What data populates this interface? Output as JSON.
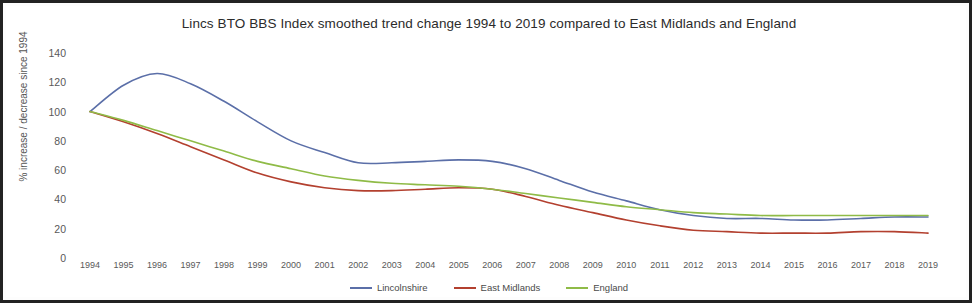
{
  "chart_data": {
    "type": "line",
    "title": "Lincs BTO BBS Index smoothed trend change 1994 to 2019 compared to East Midlands and England",
    "xlabel": "",
    "ylabel": "% increase / decrease since 1994",
    "ylim": [
      0,
      140
    ],
    "ytick_values": [
      0,
      20,
      40,
      60,
      80,
      100,
      120,
      140
    ],
    "grid": false,
    "legend_position": "bottom",
    "categories": [
      "1994",
      "1995",
      "1996",
      "1997",
      "1998",
      "1999",
      "2000",
      "2001",
      "2002",
      "2003",
      "2004",
      "2005",
      "2006",
      "2007",
      "2008",
      "2009",
      "2010",
      "2011",
      "2012",
      "2013",
      "2014",
      "2015",
      "2016",
      "2017",
      "2018",
      "2019"
    ],
    "series": [
      {
        "name": "Lincolnshire",
        "color": "#5b6fa8",
        "values": [
          100,
          118,
          126,
          119,
          107,
          93,
          80,
          72,
          65,
          65,
          66,
          67,
          66,
          61,
          53,
          45,
          39,
          33,
          29,
          27,
          27,
          26,
          26,
          27,
          28,
          28
        ]
      },
      {
        "name": "East Midlands",
        "color": "#b3402f",
        "values": [
          100,
          93,
          85,
          76,
          67,
          58,
          52,
          48,
          46,
          46,
          47,
          48,
          47,
          42,
          36,
          31,
          26,
          22,
          19,
          18,
          17,
          17,
          17,
          18,
          18,
          17
        ]
      },
      {
        "name": "England",
        "color": "#8fbb47",
        "values": [
          100,
          94,
          87,
          80,
          73,
          66,
          61,
          56,
          53,
          51,
          50,
          49,
          47,
          44,
          41,
          38,
          35,
          33,
          31,
          30,
          29,
          29,
          29,
          29,
          29,
          29
        ]
      }
    ]
  },
  "legend": {
    "items": [
      {
        "label": "Lincolnshire",
        "color": "#5b6fa8"
      },
      {
        "label": "East Midlands",
        "color": "#b3402f"
      },
      {
        "label": "England",
        "color": "#8fbb47"
      }
    ]
  }
}
